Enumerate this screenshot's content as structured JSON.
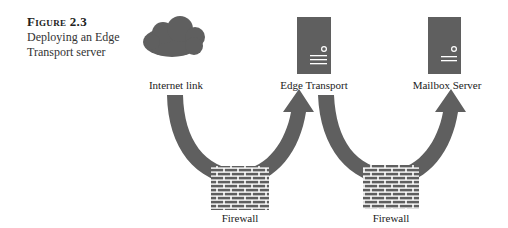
{
  "caption": {
    "figure_number": "Figure 2.3",
    "text": "Deploying an Edge Transport server"
  },
  "nodes": [
    {
      "id": "internet",
      "label": "Internet link",
      "icon": "cloud-icon"
    },
    {
      "id": "edge",
      "label": "Edge Transport",
      "icon": "server-icon"
    },
    {
      "id": "mailbox",
      "label": "Mailbox Server",
      "icon": "server-icon"
    }
  ],
  "firewalls": [
    {
      "label": "Firewall",
      "icon": "brick-wall-icon"
    },
    {
      "label": "Firewall",
      "icon": "brick-wall-icon"
    }
  ],
  "flows": [
    {
      "from": "internet",
      "via": "firewall-1",
      "to": "edge"
    },
    {
      "from": "edge",
      "via": "firewall-2",
      "to": "mailbox"
    }
  ],
  "colors": {
    "icon_fill": "#5f5f5f",
    "arrow_fill": "#5f5f5f",
    "text": "#222222"
  }
}
